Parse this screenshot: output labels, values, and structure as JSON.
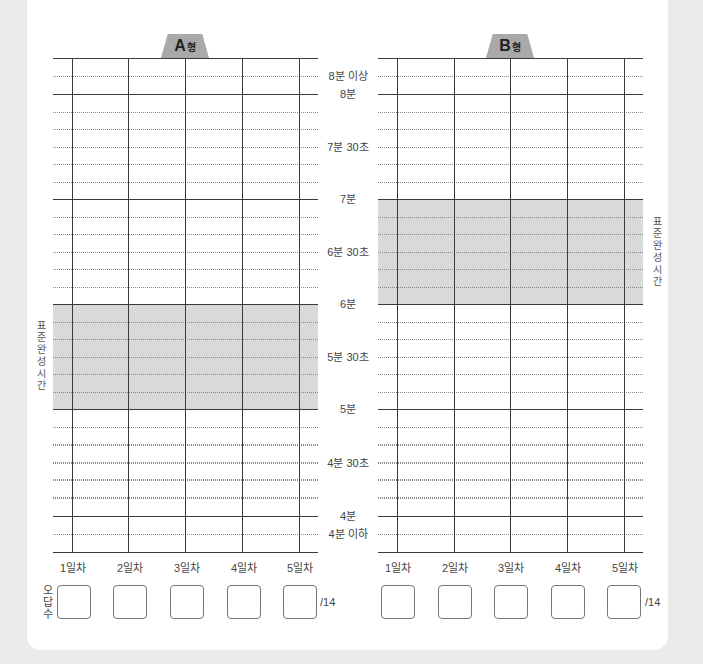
{
  "chart_a": {
    "tab_letter": "A",
    "tab_suffix": "형",
    "standard_label": "표준완성시간",
    "standard_range": [
      "5분",
      "6분"
    ]
  },
  "chart_b": {
    "tab_letter": "B",
    "tab_suffix": "형",
    "standard_label": "표준완성시간",
    "standard_range": [
      "6분",
      "7분"
    ]
  },
  "y_labels": [
    {
      "text": "8분 이상",
      "y": 76
    },
    {
      "text": "8분",
      "y": 94
    },
    {
      "text": "7분 30초",
      "y": 146.5
    },
    {
      "text": "7분",
      "y": 199
    },
    {
      "text": "6분 30초",
      "y": 251.5
    },
    {
      "text": "6분",
      "y": 304
    },
    {
      "text": "5분 30초",
      "y": 356.5
    },
    {
      "text": "5분",
      "y": 409
    },
    {
      "text": "4분 30초",
      "y": 462.5
    },
    {
      "text": "4분",
      "y": 516
    },
    {
      "text": "4분 이하",
      "y": 534
    }
  ],
  "days": [
    "1일차",
    "2일차",
    "3일차",
    "4일차",
    "5일차"
  ],
  "wrong_answers": {
    "label": "오답수",
    "total_suffix": "/14",
    "a_values": [
      "",
      "",
      "",
      "",
      ""
    ],
    "b_values": [
      "",
      "",
      "",
      "",
      ""
    ]
  },
  "colors": {
    "band": "#d9d9d9",
    "tab": "#a9a9a9",
    "grid": "#3a3a3a"
  },
  "chart_data": {
    "type": "table",
    "x": [
      "1일차",
      "2일차",
      "3일차",
      "4일차",
      "5일차"
    ],
    "y_ticks": [
      "4분 이하",
      "4분",
      "4분 30초",
      "5분",
      "5분 30초",
      "6분",
      "6분 30초",
      "7분",
      "7분 30초",
      "8분",
      "8분 이상"
    ],
    "y_grid_interval_seconds": 10,
    "series": [
      {
        "name": "A형",
        "values": [
          null,
          null,
          null,
          null,
          null
        ],
        "standard_time_band": [
          "5분",
          "6분"
        ]
      },
      {
        "name": "B형",
        "values": [
          null,
          null,
          null,
          null,
          null
        ],
        "standard_time_band": [
          "6분",
          "7분"
        ]
      }
    ],
    "wrong_answer_total": 14
  }
}
